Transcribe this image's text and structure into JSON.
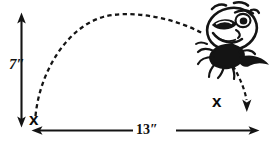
{
  "diagram": {
    "measurements": {
      "height": {
        "value": "7",
        "unit": "″",
        "label": "7″",
        "orientation": "vertical",
        "description": "maximum jump height"
      },
      "distance": {
        "value": "13",
        "unit": "″",
        "label": "13″",
        "orientation": "horizontal",
        "description": "total jump distance"
      }
    },
    "markers": {
      "takeoff": {
        "glyph": "x",
        "description": "takeoff point at bottom left"
      },
      "landing": {
        "glyph": "x",
        "description": "landing point at right"
      }
    },
    "trajectory": {
      "style": "dashed",
      "shape": "parabolic-arc",
      "direction": "left-to-right"
    },
    "descent_arrow": {
      "style": "dashed",
      "direction": "down"
    },
    "colors": {
      "ink": "#111111",
      "paper": "#ffffff"
    }
  }
}
